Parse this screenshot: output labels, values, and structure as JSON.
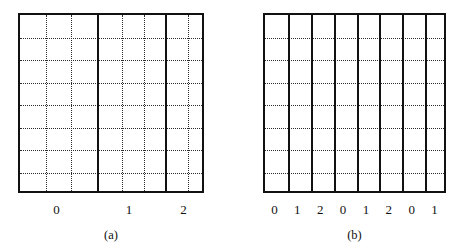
{
  "figure": {
    "background_color": "#ffffff",
    "line_color": "#111111",
    "grid_color": "#2a2a2a"
  },
  "panels": [
    {
      "id": "a",
      "caption": "(a)",
      "description": "grid with three unequal solid-bordered blocks, each subdivided by dotted lines",
      "x": 18,
      "y": 13,
      "width": 186,
      "height": 180,
      "coarse_columns": [
        {
          "label": "0",
          "left": 0,
          "width": 77,
          "dotted_subdivisions": 2,
          "label_center": 38.5
        },
        {
          "label": "1",
          "left": 77,
          "width": 68,
          "dotted_subdivisions": 2,
          "label_center": 111
        },
        {
          "label": "2",
          "left": 145,
          "width": 41,
          "dotted_subdivisions": 1,
          "label_center": 165.5
        }
      ],
      "horizontal_dotted_lines": 7,
      "tick_labels": [
        "0",
        "1",
        "2"
      ]
    },
    {
      "id": "b",
      "caption": "(b)",
      "description": "grid with eight equal solid-bordered columns labelled cyclically",
      "x": 263,
      "y": 13,
      "width": 183,
      "height": 180,
      "coarse_columns": [
        {
          "label": "0",
          "left": 0,
          "width": 22.875,
          "dotted_subdivisions": 0,
          "label_center": 11.4
        },
        {
          "label": "1",
          "left": 22.875,
          "width": 22.875,
          "dotted_subdivisions": 0,
          "label_center": 34.3
        },
        {
          "label": "2",
          "left": 45.75,
          "width": 22.875,
          "dotted_subdivisions": 0,
          "label_center": 57.2
        },
        {
          "label": "0",
          "left": 68.625,
          "width": 22.875,
          "dotted_subdivisions": 0,
          "label_center": 80.1
        },
        {
          "label": "1",
          "left": 91.5,
          "width": 22.875,
          "dotted_subdivisions": 0,
          "label_center": 102.9
        },
        {
          "label": "2",
          "left": 114.375,
          "width": 22.875,
          "dotted_subdivisions": 0,
          "label_center": 125.8
        },
        {
          "label": "0",
          "left": 137.25,
          "width": 22.875,
          "dotted_subdivisions": 0,
          "label_center": 148.7
        },
        {
          "label": "1",
          "left": 160.125,
          "width": 22.875,
          "dotted_subdivisions": 0,
          "label_center": 171.6
        }
      ],
      "horizontal_dotted_lines": 7,
      "tick_labels": [
        "0",
        "1",
        "2",
        "0",
        "1",
        "2",
        "0",
        "1"
      ]
    }
  ]
}
